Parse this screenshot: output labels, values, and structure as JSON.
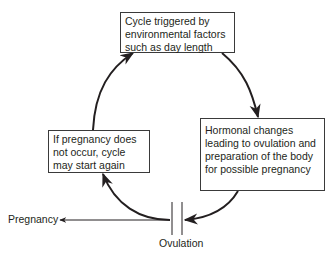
{
  "diagram": {
    "type": "cycle",
    "nodes": [
      {
        "id": "trigger",
        "text": "Cycle triggered by environmental factors such as day length"
      },
      {
        "id": "hormonal",
        "text": "Hormonal changes leading to ovulation and preparation of the body for possible pregnancy"
      },
      {
        "id": "restart",
        "text": "If pregnancy does not occur, cycle may start again"
      }
    ],
    "edges": [
      {
        "from": "trigger",
        "to": "hormonal"
      },
      {
        "from": "hormonal",
        "to": "ovulation"
      },
      {
        "from": "ovulation",
        "to": "restart"
      },
      {
        "from": "restart",
        "to": "trigger"
      },
      {
        "from": "ovulation",
        "to": "pregnancy"
      }
    ],
    "labels": {
      "ovulation": "Ovulation",
      "pregnancy": "Pregnancy"
    },
    "colors": {
      "line": "#231f20",
      "background": "#ffffff"
    }
  }
}
